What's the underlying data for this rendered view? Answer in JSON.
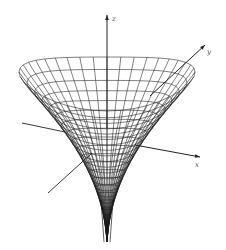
{
  "figure": {
    "type": "3d-wireframe-surface",
    "colors": {
      "background": "#ffffff",
      "mesh": "#1a1a1a",
      "axis": "#222222",
      "label": "#555555"
    },
    "axes": {
      "z": {
        "label": "z",
        "from": [
          107,
          128
        ],
        "to": [
          107,
          15
        ],
        "label_pos": [
          112,
          21
        ]
      },
      "y": {
        "label": "y",
        "from": [
          150,
          96
        ],
        "to": [
          205,
          45
        ],
        "label_pos": [
          207,
          54
        ]
      },
      "x": {
        "label": "x",
        "from": [
          135,
          145
        ],
        "to": [
          200,
          157
        ],
        "label_pos": [
          195,
          167
        ]
      },
      "x_neg": {
        "from": [
          22,
          123
        ],
        "to": [
          65,
          132
        ]
      },
      "y_neg": {
        "from": [
          48,
          193
        ],
        "to": [
          92,
          153
        ]
      }
    },
    "surface": {
      "center_x": 107,
      "rim_y": 78,
      "rim_rx": 88,
      "rim_ry": 27,
      "tip_y": 242,
      "radial_lines": 40,
      "rings": 22
    }
  }
}
